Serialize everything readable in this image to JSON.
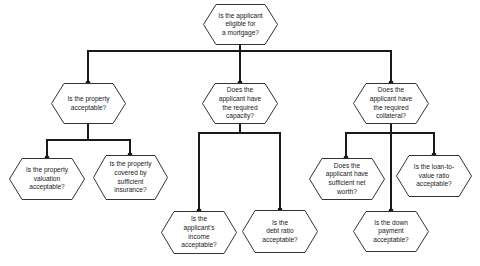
{
  "diagram": {
    "colors": {
      "line": "#1a1a1a",
      "node_fill": "#ffffff",
      "node_stroke": "#333333",
      "background": "#ffffff"
    },
    "nodes": {
      "root": {
        "label": "Is the applicant\neligible for\na mortgage?"
      },
      "property": {
        "label": "Is the property\nacceptable?"
      },
      "capacity": {
        "label": "Does the\napplicant have\nthe required\ncapacity?"
      },
      "collateral": {
        "label": "Does the\napplicant have\nthe required\ncollateral?"
      },
      "valuation": {
        "label": "Is the property\nvaluation\nacceptable?"
      },
      "insurance": {
        "label": "Is the property\ncovered by\nsufficient\ninsurance?"
      },
      "income": {
        "label": "Is the\napplicant's\nincome\nacceptable?"
      },
      "debt_ratio": {
        "label": "Is the\ndebt ratio\nacceptable?"
      },
      "net_worth": {
        "label": "Does the\napplicant have\nsufficient net\nworth?"
      },
      "down_payment": {
        "label": "Is the down\npayment\nacceptable?"
      },
      "loan_to_value": {
        "label": "Is the loan-to-\nvalue ratio\nacceptable?"
      }
    },
    "edges": [
      [
        "root",
        "property"
      ],
      [
        "root",
        "capacity"
      ],
      [
        "root",
        "collateral"
      ],
      [
        "property",
        "valuation"
      ],
      [
        "property",
        "insurance"
      ],
      [
        "capacity",
        "income"
      ],
      [
        "capacity",
        "debt_ratio"
      ],
      [
        "collateral",
        "net_worth"
      ],
      [
        "collateral",
        "down_payment"
      ],
      [
        "collateral",
        "loan_to_value"
      ]
    ]
  }
}
